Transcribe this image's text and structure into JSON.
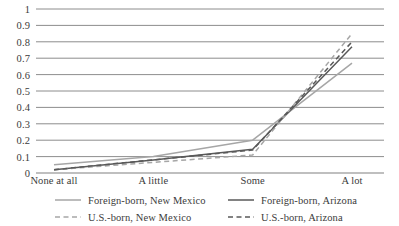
{
  "chart_data": {
    "type": "line",
    "title": "",
    "xlabel": "",
    "ylabel": "",
    "categories": [
      "None at all",
      "A little",
      "Some",
      "A lot"
    ],
    "ylim": [
      0,
      1
    ],
    "ytick_labels": [
      "0",
      "0.1",
      "0.2",
      "0.3",
      "0.4",
      "0.5",
      "0.6",
      "0.7",
      "0.8",
      "0.9",
      "1"
    ],
    "ytick_values": [
      0,
      0.1,
      0.2,
      0.3,
      0.4,
      0.5,
      0.6,
      0.7,
      0.8,
      0.9,
      1
    ],
    "grid": "horizontal",
    "legend_position": "bottom",
    "series": [
      {
        "name": "Foreign-born, New Mexico",
        "values": [
          0.05,
          0.1,
          0.2,
          0.67
        ],
        "color": "#a6a6a6",
        "style": "solid"
      },
      {
        "name": "Foreign-born, Arizona",
        "values": [
          0.02,
          0.08,
          0.145,
          0.77
        ],
        "color": "#595959",
        "style": "solid"
      },
      {
        "name": "U.S.-born, New Mexico",
        "values": [
          0.02,
          0.065,
          0.11,
          0.85
        ],
        "color": "#a6a6a6",
        "style": "dashed"
      },
      {
        "name": "U.S.-born, Arizona",
        "values": [
          0.02,
          0.08,
          0.14,
          0.8
        ],
        "color": "#595959",
        "style": "dashed"
      }
    ]
  },
  "axes": {
    "y_ticks": [
      {
        "label": "1",
        "value": 1
      },
      {
        "label": "0.9",
        "value": 0.9
      },
      {
        "label": "0.8",
        "value": 0.8
      },
      {
        "label": "0.7",
        "value": 0.7
      },
      {
        "label": "0.6",
        "value": 0.6
      },
      {
        "label": "0.5",
        "value": 0.5
      },
      {
        "label": "0.4",
        "value": 0.4
      },
      {
        "label": "0.3",
        "value": 0.3
      },
      {
        "label": "0.2",
        "value": 0.2
      },
      {
        "label": "0.1",
        "value": 0.1
      },
      {
        "label": "0",
        "value": 0
      }
    ],
    "x_ticks": [
      {
        "label": "None at all"
      },
      {
        "label": "A little"
      },
      {
        "label": "Some"
      },
      {
        "label": "A lot"
      }
    ]
  },
  "legend": {
    "entries": [
      {
        "label": "Foreign-born, New Mexico"
      },
      {
        "label": "Foreign-born, Arizona"
      },
      {
        "label": "U.S.-born, New Mexico"
      },
      {
        "label": "U.S.-born, Arizona"
      }
    ]
  },
  "style": {
    "gridline_color": "#808080",
    "text_color": "#3b3b3b",
    "background": "#ffffff"
  }
}
